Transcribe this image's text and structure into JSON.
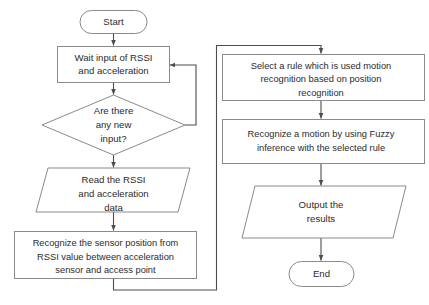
{
  "diagram": {
    "type": "flowchart",
    "canvas": {
      "width": 429,
      "height": 305
    },
    "colors": {
      "background": "#ffffff",
      "node_stroke": "#8a8a8a",
      "node_fill": "#ffffff",
      "text": "#2b2b2b",
      "connector": "#4d4d4d"
    }
  },
  "nodes": {
    "start": {
      "id": "start",
      "shape": "terminator",
      "label": "Start",
      "lines": [
        "Start"
      ]
    },
    "wait_input": {
      "id": "wait_input",
      "shape": "process",
      "label": "Wait input of RSSI and acceleration",
      "lines": [
        "Wait input of RSSI",
        "and acceleration"
      ]
    },
    "decision_new_input": {
      "id": "decision_new_input",
      "shape": "decision",
      "label": "Are there any new input?",
      "lines": [
        "Are there",
        "any new",
        "input?"
      ]
    },
    "read_data": {
      "id": "read_data",
      "shape": "data",
      "label": "Read the RSSI and acceleration data",
      "lines": [
        "Read the RSSI",
        "and acceleration",
        "data"
      ]
    },
    "recognize_position": {
      "id": "recognize_position",
      "shape": "process",
      "label": "Recognize the sensor position from RSSI value between acceleration sensor and access point",
      "lines": [
        "Recognize the sensor position from",
        "RSSI value between acceleration",
        "sensor and access point"
      ]
    },
    "select_rule": {
      "id": "select_rule",
      "shape": "process",
      "label": "Select a rule which is used motion recognition based on position recognition",
      "lines": [
        "Select a rule which is used motion",
        "recognition based on position",
        "recognition"
      ]
    },
    "fuzzy_inference": {
      "id": "fuzzy_inference",
      "shape": "process",
      "label": "Recognize a motion by using Fuzzy inference with the selected rule",
      "lines": [
        "Recognize a motion by using Fuzzy",
        "inference with the selected rule"
      ]
    },
    "output_results": {
      "id": "output_results",
      "shape": "data",
      "label": "Output the results",
      "lines": [
        "Output the",
        "results"
      ]
    },
    "end": {
      "id": "end",
      "shape": "terminator",
      "label": "End",
      "lines": [
        "End"
      ]
    }
  },
  "edges": [
    {
      "id": "e-start-wait",
      "from": "start",
      "to": "wait_input",
      "label": ""
    },
    {
      "id": "e-wait-decision",
      "from": "wait_input",
      "to": "decision_new_input",
      "label": ""
    },
    {
      "id": "e-decision-wait-loop",
      "from": "decision_new_input",
      "to": "wait_input",
      "label": ""
    },
    {
      "id": "e-decision-read",
      "from": "decision_new_input",
      "to": "read_data",
      "label": ""
    },
    {
      "id": "e-read-position",
      "from": "read_data",
      "to": "recognize_position",
      "label": ""
    },
    {
      "id": "e-position-select",
      "from": "recognize_position",
      "to": "select_rule",
      "label": ""
    },
    {
      "id": "e-select-fuzzy",
      "from": "select_rule",
      "to": "fuzzy_inference",
      "label": ""
    },
    {
      "id": "e-fuzzy-output",
      "from": "fuzzy_inference",
      "to": "output_results",
      "label": ""
    },
    {
      "id": "e-output-end",
      "from": "output_results",
      "to": "end",
      "label": ""
    }
  ]
}
